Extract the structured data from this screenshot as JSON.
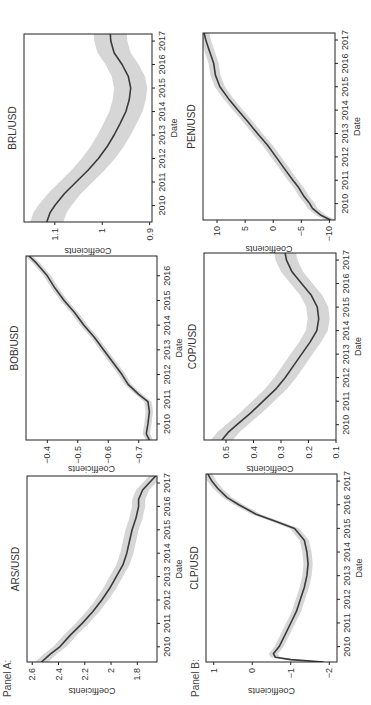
{
  "panels": [
    {
      "label": "Panel A:"
    },
    {
      "label": "Panel B:"
    }
  ],
  "colors": {
    "line": "#3a3a3a",
    "band": "#d6d6d6",
    "frame": "#222222"
  },
  "chart_data": [
    {
      "type": "line",
      "panel": "A",
      "title": "ARS/USD",
      "xlabel": "Date",
      "ylabel": "Coefficients",
      "xticks": [
        2010,
        2011,
        2012,
        2013,
        2014,
        2015,
        2016,
        2017
      ],
      "xlim": [
        2009.35,
        2017.3
      ],
      "ylim": [
        1.65,
        2.64
      ],
      "yticks": [
        1.8,
        2.0,
        2.2,
        2.4,
        2.6
      ],
      "x": [
        2009.35,
        2009.7,
        2010.0,
        2010.5,
        2011.0,
        2011.5,
        2012.0,
        2012.5,
        2013.0,
        2013.5,
        2014.0,
        2014.5,
        2015.0,
        2015.5,
        2016.0,
        2016.3,
        2016.7,
        2017.0,
        2017.3
      ],
      "y": [
        2.53,
        2.46,
        2.39,
        2.31,
        2.22,
        2.14,
        2.07,
        2.01,
        1.96,
        1.91,
        1.88,
        1.86,
        1.84,
        1.81,
        1.79,
        1.79,
        1.76,
        1.71,
        1.66
      ],
      "band_halfwidth": 0.05
    },
    {
      "type": "line",
      "panel": "A",
      "title": "BOB/USD",
      "xlabel": "Date",
      "ylabel": "Coefficients",
      "xticks": [
        2010,
        2011,
        2012,
        2013,
        2014,
        2015,
        2016
      ],
      "xlim": [
        2009.35,
        2016.8
      ],
      "ylim": [
        -0.76,
        -0.33
      ],
      "yticks": [
        -0.7,
        -0.6,
        -0.5,
        -0.4
      ],
      "x": [
        2009.35,
        2009.6,
        2010.0,
        2010.5,
        2010.9,
        2011.2,
        2011.6,
        2012.0,
        2012.5,
        2013.0,
        2013.5,
        2014.0,
        2014.5,
        2015.0,
        2015.5,
        2016.0,
        2016.5,
        2016.8
      ],
      "y": [
        -0.735,
        -0.725,
        -0.73,
        -0.735,
        -0.73,
        -0.7,
        -0.665,
        -0.645,
        -0.615,
        -0.585,
        -0.555,
        -0.52,
        -0.49,
        -0.455,
        -0.425,
        -0.4,
        -0.365,
        -0.34
      ],
      "band_halfwidth": 0.012
    },
    {
      "type": "line",
      "panel": "A",
      "title": "BRL/USD",
      "xlabel": "Date",
      "ylabel": "Coefficients",
      "xticks": [
        2010,
        2011,
        2012,
        2013,
        2014,
        2015,
        2016,
        2017
      ],
      "xlim": [
        2009.3,
        2017.3
      ],
      "ylim": [
        0.895,
        1.165
      ],
      "yticks": [
        0.9,
        1.0,
        1.1
      ],
      "x": [
        2009.3,
        2009.7,
        2010.0,
        2010.5,
        2011.0,
        2011.5,
        2012.0,
        2012.5,
        2013.0,
        2013.5,
        2014.0,
        2014.5,
        2015.0,
        2015.5,
        2016.0,
        2016.5,
        2017.0,
        2017.3
      ],
      "y": [
        1.117,
        1.11,
        1.1,
        1.08,
        1.055,
        1.03,
        1.008,
        0.99,
        0.975,
        0.962,
        0.95,
        0.943,
        0.94,
        0.945,
        0.958,
        0.975,
        0.982,
        0.983
      ],
      "band_halfwidth": 0.035
    },
    {
      "type": "line",
      "panel": "B",
      "title": "CLP/USD",
      "xlabel": "Date",
      "ylabel": "Coefficients",
      "xticks": [
        2010,
        2011,
        2012,
        2013,
        2014,
        2015,
        2016,
        2017
      ],
      "xlim": [
        2009.35,
        2017.3
      ],
      "ylim": [
        -2.2,
        1.2
      ],
      "yticks": [
        -2,
        -1,
        0,
        1
      ],
      "x": [
        2009.35,
        2009.45,
        2009.55,
        2009.7,
        2010.0,
        2010.5,
        2011.0,
        2011.5,
        2012.0,
        2012.5,
        2013.0,
        2013.5,
        2014.0,
        2014.5,
        2015.0,
        2015.3,
        2015.6,
        2016.0,
        2016.3,
        2016.7,
        2017.0,
        2017.3
      ],
      "y": [
        -1.85,
        -1.0,
        -0.6,
        -0.55,
        -0.7,
        -0.85,
        -1.0,
        -1.15,
        -1.25,
        -1.35,
        -1.42,
        -1.45,
        -1.42,
        -1.35,
        -1.1,
        -0.6,
        -0.1,
        0.35,
        0.65,
        0.9,
        1.05,
        1.15
      ],
      "band_halfwidth": 0.12
    },
    {
      "type": "line",
      "panel": "B",
      "title": "COP/USD",
      "xlabel": "Date",
      "ylabel": "Coefficients",
      "xticks": [
        2010,
        2011,
        2012,
        2013,
        2014,
        2015,
        2016,
        2017
      ],
      "xlim": [
        2009.35,
        2017.3
      ],
      "ylim": [
        0.1,
        0.58
      ],
      "yticks": [
        0.1,
        0.2,
        0.3,
        0.4,
        0.5
      ],
      "x": [
        2009.35,
        2009.7,
        2010.0,
        2010.5,
        2011.0,
        2011.5,
        2012.0,
        2012.5,
        2013.0,
        2013.5,
        2014.0,
        2014.5,
        2015.0,
        2015.5,
        2016.0,
        2016.5,
        2017.0,
        2017.3
      ],
      "y": [
        0.515,
        0.49,
        0.46,
        0.41,
        0.365,
        0.32,
        0.285,
        0.255,
        0.225,
        0.195,
        0.17,
        0.163,
        0.168,
        0.19,
        0.225,
        0.26,
        0.28,
        0.285
      ],
      "band_halfwidth": 0.04
    },
    {
      "type": "line",
      "panel": "B",
      "title": "PEN/USD",
      "xlabel": "Date",
      "ylabel": "Coefficients",
      "xticks": [
        2010,
        2011,
        2012,
        2013,
        2014,
        2015,
        2016,
        2017
      ],
      "xlim": [
        2009.3,
        2017.3
      ],
      "ylim": [
        -11,
        12.5
      ],
      "yticks": [
        -10,
        -5,
        0,
        5,
        10
      ],
      "x": [
        2009.3,
        2009.5,
        2009.8,
        2010.0,
        2010.3,
        2010.7,
        2011.0,
        2011.5,
        2012.0,
        2012.5,
        2013.0,
        2013.5,
        2014.0,
        2014.5,
        2015.0,
        2015.5,
        2016.0,
        2016.5,
        2017.0,
        2017.3
      ],
      "y": [
        -10.2,
        -8.5,
        -7.0,
        -6.5,
        -5.5,
        -4.5,
        -3.5,
        -2.0,
        -0.5,
        1.0,
        2.8,
        4.5,
        6.3,
        8.0,
        9.5,
        10.3,
        10.6,
        11.3,
        12.0,
        12.3
      ],
      "band_halfwidth": 0.9
    }
  ]
}
